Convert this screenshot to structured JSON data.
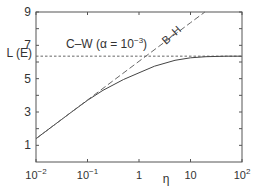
{
  "chart_data": {
    "type": "line",
    "title": "",
    "xlabel": "η",
    "ylabel": "L (E)",
    "xscale": "log",
    "xlim": [
      0.01,
      100
    ],
    "ylim": [
      0,
      9
    ],
    "xticks": [
      {
        "value": 0.01,
        "base": "10",
        "exp": "−2"
      },
      {
        "value": 0.1,
        "base": "10",
        "exp": "−1"
      },
      {
        "value": 1,
        "base": "1",
        "exp": ""
      },
      {
        "value": 10,
        "base": "10",
        "exp": ""
      },
      {
        "value": 100,
        "base": "10",
        "exp": "2"
      }
    ],
    "yticks": [
      1,
      3,
      5,
      7,
      9
    ],
    "y_minor_ticks": [
      2,
      4,
      6,
      8
    ],
    "grid": false,
    "legend": "none",
    "reference_line": {
      "label": "L (E)",
      "value": 6.35,
      "style": "dotted-dashed"
    },
    "series": [
      {
        "name": "C–W (α = 10⁻³)",
        "style": "solid",
        "x": [
          0.01,
          0.02,
          0.05,
          0.1,
          0.2,
          0.5,
          1,
          2,
          5,
          10,
          20,
          50,
          100
        ],
        "y": [
          1.4,
          2.1,
          3.02,
          3.7,
          4.3,
          4.95,
          5.35,
          5.75,
          6.1,
          6.25,
          6.32,
          6.35,
          6.35
        ]
      },
      {
        "name": "B–H",
        "style": "dashed",
        "x": [
          0.01,
          0.1,
          1,
          10,
          19
        ],
        "y": [
          1.4,
          3.72,
          6.04,
          8.36,
          9.0
        ]
      }
    ],
    "annotations": [
      {
        "text": "C–W (α = 10⁻³)",
        "near": {
          "x": 0.07,
          "y": 7.2
        }
      },
      {
        "text": "B–H",
        "near": {
          "x": 3.5,
          "y": 8.1
        },
        "rotation": -40
      },
      {
        "text": "L (E)",
        "near": "y-axis at 6.35"
      }
    ]
  },
  "labels": {
    "xlabel": "η",
    "ylabel": "L (E)",
    "cw_label": "C–W (α = 10",
    "cw_exp": "−3",
    "cw_close": ")",
    "bh_label": "B–H"
  }
}
